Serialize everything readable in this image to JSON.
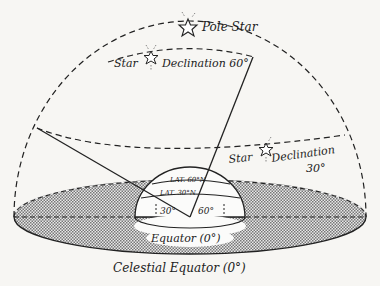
{
  "diagram": {
    "labels": {
      "pole_star": "Pole Star",
      "star_60": "Star",
      "declination_60": "Declination 60°",
      "star_30": "Star",
      "declination_30_line1": "Declination",
      "declination_30_line2": "30°",
      "lat_60": "LAT. 60°N",
      "lat_30": "LAT. 30°N",
      "angle_30": "30°",
      "angle_60": "60°",
      "equator": "Equator (0°)",
      "celestial_equator": "Celestial Equator (0°)"
    },
    "colors": {
      "ink": "#222222",
      "background": "#f7f6f3",
      "shading": "#9a9a9a"
    }
  }
}
